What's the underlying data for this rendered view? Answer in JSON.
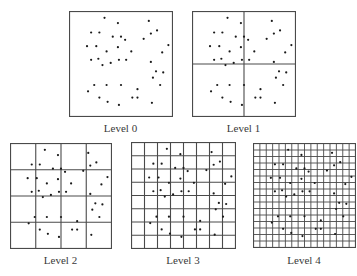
{
  "diagram": {
    "type": "quadtree-grid-levels",
    "colors": {
      "line": "#4a4a4a",
      "dot": "#1a1a1a",
      "background": "#ffffff"
    },
    "points": [
      [
        0.34,
        0.06
      ],
      [
        0.47,
        0.11
      ],
      [
        0.77,
        0.09
      ],
      [
        0.21,
        0.2
      ],
      [
        0.29,
        0.2
      ],
      [
        0.79,
        0.21
      ],
      [
        0.85,
        0.18
      ],
      [
        0.42,
        0.24
      ],
      [
        0.5,
        0.24
      ],
      [
        0.54,
        0.27
      ],
      [
        0.72,
        0.26
      ],
      [
        0.17,
        0.33
      ],
      [
        0.26,
        0.33
      ],
      [
        0.47,
        0.34
      ],
      [
        0.96,
        0.32
      ],
      [
        0.36,
        0.38
      ],
      [
        0.6,
        0.38
      ],
      [
        0.9,
        0.39
      ],
      [
        0.21,
        0.46
      ],
      [
        0.28,
        0.45
      ],
      [
        0.32,
        0.51
      ],
      [
        0.4,
        0.49
      ],
      [
        0.48,
        0.46
      ],
      [
        0.55,
        0.46
      ],
      [
        0.79,
        0.48
      ],
      [
        0.84,
        0.57
      ],
      [
        0.91,
        0.58
      ],
      [
        0.81,
        0.63
      ],
      [
        0.24,
        0.7
      ],
      [
        0.36,
        0.7
      ],
      [
        0.5,
        0.7
      ],
      [
        0.66,
        0.74
      ],
      [
        0.88,
        0.7
      ],
      [
        0.18,
        0.76
      ],
      [
        0.29,
        0.82
      ],
      [
        0.37,
        0.86
      ],
      [
        0.48,
        0.89
      ],
      [
        0.61,
        0.82
      ],
      [
        0.66,
        0.82
      ],
      [
        0.8,
        0.87
      ]
    ],
    "panels": [
      {
        "label": "Level 0",
        "divisions": 1,
        "x": 69,
        "y": 11,
        "w": 103,
        "h": 105,
        "label_y": 122
      },
      {
        "label": "Level 1",
        "divisions": 2,
        "x": 192,
        "y": 11,
        "w": 103,
        "h": 105,
        "label_y": 122
      },
      {
        "label": "Level 2",
        "divisions": 4,
        "x": 10,
        "y": 143,
        "w": 101,
        "h": 105,
        "label_y": 254
      },
      {
        "label": "Level 3",
        "divisions": 8,
        "x": 131,
        "y": 142,
        "w": 104,
        "h": 106,
        "label_y": 254
      },
      {
        "label": "Level 4",
        "divisions": 16,
        "x": 253,
        "y": 143,
        "w": 102,
        "h": 104,
        "label_y": 254
      }
    ]
  }
}
